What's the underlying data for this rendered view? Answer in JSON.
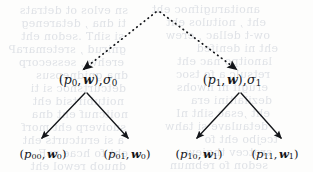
{
  "figure": {
    "type": "tree-diagram",
    "caption": "",
    "background_color": "#fdfdfc",
    "ink_color": "#14161a",
    "ghost_color": "#c8cdd6"
  },
  "nodes": {
    "root": {
      "id": "root",
      "label": "",
      "x": 158,
      "y": 12,
      "visible": false
    },
    "left_parent": {
      "id": "p0",
      "x": 88,
      "y": 80,
      "open_paren": "(",
      "p": "p",
      "p_sub": "0",
      "comma": ",",
      "w": "w",
      "w_sub": "",
      "close_paren": ")",
      "tail_comma": ",",
      "sigma": "σ",
      "sigma_sub": "0",
      "plain": "(p0, w), σ0"
    },
    "right_parent": {
      "id": "p1",
      "x": 232,
      "y": 80,
      "open_paren": "(",
      "p": "p",
      "p_sub": "1",
      "comma": ",",
      "w": "w",
      "w_sub": "",
      "close_paren": ")",
      "tail_comma": ",",
      "sigma": "σ",
      "sigma_sub": "1",
      "plain": "(p1, w), σ1"
    },
    "leaf_00": {
      "id": "p00",
      "x": 43,
      "y": 154,
      "open_paren": "(",
      "p": "p",
      "p_sub": "00",
      "comma": ",",
      "w": "w",
      "w_sub": "0",
      "close_paren": ")",
      "plain": "(p00, w0)"
    },
    "leaf_01": {
      "id": "p01",
      "x": 127,
      "y": 154,
      "open_paren": "(",
      "p": "p",
      "p_sub": "01",
      "comma": ",",
      "w": "w",
      "w_sub": "0",
      "close_paren": ")",
      "plain": "(p01, w0)"
    },
    "leaf_10": {
      "id": "p10",
      "x": 199,
      "y": 154,
      "open_paren": "(",
      "p": "p",
      "p_sub": "10",
      "comma": ",",
      "w": "w",
      "w_sub": "1",
      "close_paren": ")",
      "plain": "(p10, w1)"
    },
    "leaf_11": {
      "id": "p11",
      "x": 275,
      "y": 154,
      "open_paren": "(",
      "p": "p",
      "p_sub": "11",
      "comma": ",",
      "w": "w",
      "w_sub": "1",
      "close_paren": ")",
      "plain": "(p11, w1)"
    }
  },
  "edges": [
    {
      "id": "root-to-left",
      "style": "dotted",
      "from": "root",
      "to": "left_parent",
      "x1": 156,
      "y1": 12,
      "x2": 84,
      "y2": 69
    },
    {
      "id": "root-to-right",
      "style": "dotted",
      "from": "root",
      "to": "right_parent",
      "x1": 160,
      "y1": 12,
      "x2": 236,
      "y2": 69
    },
    {
      "id": "left-to-00",
      "style": "solid",
      "from": "left_parent",
      "to": "leaf_00",
      "x1": 85,
      "y1": 93,
      "x2": 42,
      "y2": 139
    },
    {
      "id": "left-to-01",
      "style": "solid",
      "from": "left_parent",
      "to": "leaf_01",
      "x1": 87,
      "y1": 93,
      "x2": 128,
      "y2": 139
    },
    {
      "id": "right-to-10",
      "style": "solid",
      "from": "right_parent",
      "to": "leaf_10",
      "x1": 239,
      "y1": 93,
      "x2": 197,
      "y2": 139
    },
    {
      "id": "right-to-11",
      "style": "solid",
      "from": "right_parent",
      "to": "leaf_11",
      "x1": 241,
      "y1": 93,
      "x2": 281,
      "y2": 139
    }
  ],
  "ghost_text": {
    "note": "faint show-through text from the reverse side of the scanned page",
    "lines": [
      {
        "text": "sn evlos ot detrats",
        "x": 8,
        "y": 4,
        "size": 11
      },
      {
        "text": "anoitarugifnoc eht",
        "x": 140,
        "y": 3,
        "size": 11
      },
      {
        "text": "ti dna , detareneg",
        "x": 6,
        "y": 17,
        "size": 11
      },
      {
        "text": "eht , noitulos eht",
        "x": 146,
        "y": 16,
        "size": 11
      },
      {
        "text": "si sihT .sedon eht",
        "x": 4,
        "y": 30,
        "size": 11
      },
      {
        "text": "ow-t dellac , erew",
        "x": 150,
        "y": 29,
        "size": 11
      },
      {
        "text": "gnirud , sretemaraP",
        "x": 6,
        "y": 43,
        "size": 11
      },
      {
        "text": "eht ni denifed",
        "x": 158,
        "y": 42,
        "size": 11
      },
      {
        "text": "erehw , sessecorp",
        "x": 4,
        "y": 56,
        "size": 11
      },
      {
        "text": "lanoitpo nac eht",
        "x": 152,
        "y": 55,
        "size": 11
      },
      {
        "text": "dna gnidnepsus",
        "x": 8,
        "y": 69,
        "size": 11
      },
      {
        "text": "retsulc a fo tsoc",
        "x": 150,
        "y": 68,
        "size": 11
      },
      {
        "text": "detcurtsnoc si ti",
        "x": 6,
        "y": 82,
        "size": 11
      },
      {
        "text": "erugif ni nwohs",
        "x": 148,
        "y": 81,
        "size": 11
      },
      {
        "text": "noitubirtsid eht",
        "x": 4,
        "y": 95,
        "size": 11
      },
      {
        "text": "dezilaitini era",
        "x": 152,
        "y": 94,
        "size": 11
      },
      {
        "text": "noitcnuf eht dna",
        "x": 8,
        "y": 108,
        "size": 11
      },
      {
        "text": "eht ,esac siht nI",
        "x": 150,
        "y": 107,
        "size": 11
      },
      {
        "text": "suoiverp eht morf",
        "x": 6,
        "y": 121,
        "size": 11
      },
      {
        "text": "detaulave si tahw",
        "x": 148,
        "y": 120,
        "size": 11
      },
      {
        "text": "a si erutcurts eht",
        "x": 4,
        "y": 134,
        "size": 11
      },
      {
        "text": "tcejbo eht fo",
        "x": 158,
        "y": 133,
        "size": 11
      },
      {
        "text": "eht fo hcae roF",
        "x": 8,
        "y": 147,
        "size": 11
      },
      {
        "text": "srotcev thgiew",
        "x": 152,
        "y": 146,
        "size": 11
      },
      {
        "text": "dnuob rewol eht",
        "x": 6,
        "y": 160,
        "size": 11
      },
      {
        "text": "sedon fo rebmun",
        "x": 148,
        "y": 159,
        "size": 11
      }
    ]
  }
}
